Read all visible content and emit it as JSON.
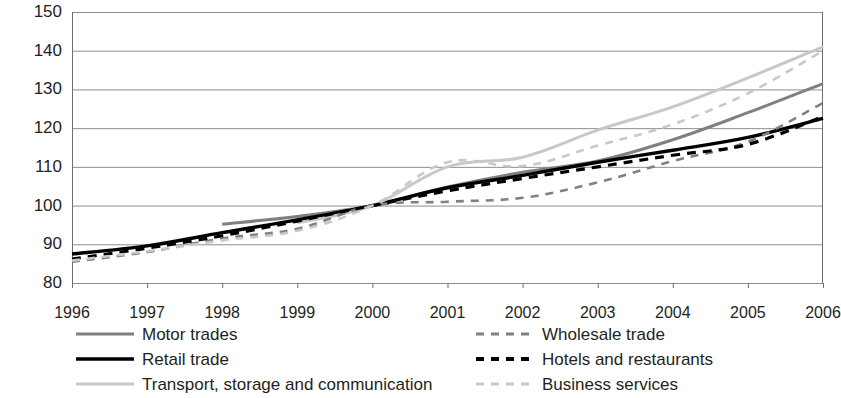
{
  "chart_data": {
    "type": "line",
    "title": "",
    "subtitle": "",
    "xlabel": "",
    "ylabel": "",
    "x": [
      1996,
      1997,
      1998,
      1999,
      2000,
      2001,
      2002,
      2003,
      2004,
      2005,
      2006
    ],
    "categories": [
      "1996",
      "1997",
      "1998",
      "1999",
      "2000",
      "2001",
      "2002",
      "2003",
      "2004",
      "2005",
      "2006"
    ],
    "xlim": [
      1996,
      2006
    ],
    "ylim": [
      80,
      150
    ],
    "yticks": [
      80,
      90,
      100,
      110,
      120,
      130,
      140,
      150
    ],
    "xticks": [
      "1996",
      "1997",
      "1998",
      "1999",
      "2000",
      "2001",
      "2002",
      "2003",
      "2004",
      "2005",
      "2006"
    ],
    "grid": "horizontal",
    "legend_position": "bottom",
    "legend_columns": 2,
    "index_base_year": 2000,
    "index_base_value": 100,
    "series": [
      {
        "name": "Motor trades",
        "color": "#808080",
        "style": "solid",
        "width": 3,
        "x": [
          1998,
          1999,
          2000,
          2001,
          2002,
          2003,
          2004,
          2005,
          2006
        ],
        "values": [
          95.2,
          97.2,
          100.0,
          104.8,
          108.6,
          111.5,
          117.0,
          124.0,
          131.5
        ]
      },
      {
        "name": "Retail trade",
        "color": "#000000",
        "style": "solid",
        "width": 3.4,
        "x": [
          1996,
          1997,
          1998,
          1999,
          2000,
          2001,
          2002,
          2003,
          2004,
          2005,
          2006
        ],
        "values": [
          87.5,
          89.6,
          93.0,
          96.3,
          100.0,
          104.6,
          107.8,
          111.2,
          114.3,
          117.6,
          122.5
        ]
      },
      {
        "name": "Transport, storage and communication",
        "color": "#c8c8c8",
        "style": "solid",
        "width": 3,
        "x": [
          1999,
          2000,
          2001,
          2002,
          2003,
          2004,
          2005,
          2006
        ],
        "values": [
          95.5,
          100.0,
          110.0,
          112.5,
          119.5,
          125.5,
          133.0,
          141.0
        ]
      },
      {
        "name": "Wholesale trade",
        "color": "#808080",
        "style": "dashed",
        "width": 2.6,
        "x": [
          1996,
          1997,
          1998,
          1999,
          2000,
          2001,
          2002,
          2003,
          2004,
          2005,
          2006
        ],
        "values": [
          85.5,
          88.0,
          91.5,
          94.0,
          100.0,
          101.0,
          102.0,
          106.0,
          111.5,
          116.5,
          126.5
        ]
      },
      {
        "name": "Hotels and restaurants",
        "color": "#000000",
        "style": "dashed",
        "width": 3.2,
        "x": [
          1996,
          1997,
          1998,
          1999,
          2000,
          2001,
          2002,
          2003,
          2004,
          2005,
          2006
        ],
        "values": [
          86.2,
          89.0,
          92.2,
          96.0,
          100.0,
          103.8,
          107.0,
          110.0,
          113.0,
          115.8,
          123.0
        ]
      },
      {
        "name": "Business services",
        "color": "#c8c8c8",
        "style": "dashed",
        "width": 2.6,
        "x": [
          1996,
          1997,
          1998,
          1999,
          2000,
          2001,
          2002,
          2003,
          2004,
          2005,
          2006
        ],
        "values": [
          85.8,
          88.2,
          91.0,
          93.5,
          100.0,
          111.2,
          110.2,
          115.5,
          121.0,
          129.0,
          140.0
        ]
      }
    ]
  },
  "axis": {
    "y_ticks": [
      "150",
      "140",
      "130",
      "120",
      "110",
      "100",
      "90",
      "80"
    ],
    "x_ticks": [
      "1996",
      "1997",
      "1998",
      "1999",
      "2000",
      "2001",
      "2002",
      "2003",
      "2004",
      "2005",
      "2006"
    ]
  },
  "legend": {
    "items": [
      {
        "label": "Motor trades",
        "color": "#808080",
        "style": "solid",
        "column": "left",
        "row": 0
      },
      {
        "label": "Retail trade",
        "color": "#000000",
        "style": "solid",
        "column": "left",
        "row": 1
      },
      {
        "label": "Transport, storage and communication",
        "color": "#c8c8c8",
        "style": "solid",
        "column": "left",
        "row": 2
      },
      {
        "label": "Wholesale trade",
        "color": "#808080",
        "style": "dashed",
        "column": "right",
        "row": 0
      },
      {
        "label": "Hotels and restaurants",
        "color": "#000000",
        "style": "dashed",
        "column": "right",
        "row": 1
      },
      {
        "label": "Business services",
        "color": "#c8c8c8",
        "style": "dashed",
        "column": "right",
        "row": 2
      }
    ]
  },
  "colors": {
    "background": "#ffffff",
    "grid": "#8d8d8d",
    "axis": "#6f6f6f",
    "text": "#231f20"
  }
}
